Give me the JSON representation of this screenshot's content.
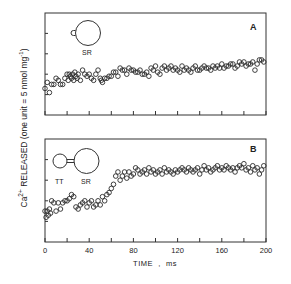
{
  "chart_data": [
    {
      "type": "scatter",
      "panel": "A",
      "panel_label": "A",
      "inset": {
        "labels": [
          "SR"
        ],
        "description": "small TT vesicle attached to large SR vesicle (isolated SR)"
      },
      "xlabel": "TIME , ms",
      "ylabel": "Ca2+ RELEASED (one unit = 5 nmol mg-1)",
      "xlim": [
        0,
        200
      ],
      "ylim": [
        0,
        5
      ],
      "x_ticks": [
        0,
        20,
        40,
        60,
        80,
        100,
        120,
        140,
        160,
        180,
        200
      ],
      "y_ticks": [
        1,
        2,
        3,
        4
      ],
      "marker": "open-circle",
      "x": [
        0,
        2,
        4,
        6,
        8,
        10,
        12,
        14,
        16,
        18,
        20,
        21,
        22,
        23,
        24,
        25,
        26,
        27,
        28,
        29,
        30,
        32,
        34,
        36,
        38,
        40,
        42,
        44,
        46,
        48,
        50,
        51,
        52,
        54,
        56,
        58,
        60,
        62,
        64,
        66,
        68,
        70,
        72,
        74,
        76,
        78,
        80,
        82,
        84,
        86,
        88,
        90,
        92,
        94,
        96,
        98,
        100,
        102,
        104,
        106,
        108,
        110,
        112,
        114,
        116,
        118,
        120,
        122,
        124,
        126,
        128,
        130,
        132,
        134,
        136,
        138,
        140,
        142,
        144,
        146,
        148,
        150,
        152,
        154,
        156,
        158,
        160,
        162,
        164,
        166,
        168,
        170,
        172,
        174,
        176,
        178,
        180,
        182,
        184,
        186,
        188,
        190,
        192,
        194,
        196,
        198
      ],
      "values": [
        1.3,
        1.6,
        1.1,
        1.5,
        1.5,
        1.8,
        1.7,
        1.5,
        1.5,
        1.8,
        2.0,
        1.7,
        2.0,
        1.9,
        1.8,
        2.0,
        1.7,
        2.1,
        1.9,
        1.8,
        2.0,
        1.7,
        2.2,
        2.0,
        1.9,
        2.0,
        1.8,
        1.7,
        2.0,
        2.2,
        1.8,
        1.7,
        1.6,
        1.8,
        1.8,
        1.9,
        1.9,
        2.1,
        2.1,
        1.9,
        2.3,
        2.2,
        2.2,
        2.0,
        2.3,
        2.2,
        2.2,
        2.1,
        2.1,
        2.2,
        2.0,
        2.0,
        2.1,
        1.9,
        2.3,
        2.2,
        2.4,
        2.1,
        2.0,
        2.3,
        2.4,
        2.2,
        2.3,
        2.4,
        2.2,
        2.3,
        2.2,
        2.1,
        2.4,
        2.2,
        2.3,
        2.2,
        2.1,
        2.3,
        2.4,
        2.2,
        2.2,
        2.3,
        2.4,
        2.3,
        2.3,
        2.2,
        2.4,
        2.3,
        2.4,
        2.3,
        2.5,
        2.3,
        2.4,
        2.4,
        2.5,
        2.5,
        2.3,
        2.4,
        2.6,
        2.5,
        2.6,
        2.4,
        2.5,
        2.5,
        2.6,
        2.2,
        2.5,
        2.7,
        2.7,
        2.6
      ]
    },
    {
      "type": "scatter",
      "panel": "B",
      "panel_label": "B",
      "inset": {
        "labels": [
          "TT",
          "SR"
        ],
        "description": "TT vesicle joined to SR vesicle (triad)"
      },
      "xlabel": "TIME , ms",
      "ylabel": "Ca2+ RELEASED (one unit = 5 nmol mg-1)",
      "xlim": [
        0,
        200
      ],
      "ylim": [
        0,
        5
      ],
      "x_ticks": [
        0,
        20,
        40,
        60,
        80,
        100,
        120,
        140,
        160,
        180,
        200
      ],
      "x_tick_labels": [
        "0",
        "40",
        "80",
        "120",
        "160",
        "200"
      ],
      "y_ticks": [
        1,
        2,
        3,
        4
      ],
      "marker": "open-circle",
      "x": [
        0,
        1,
        2,
        3,
        4,
        5,
        6,
        8,
        10,
        12,
        14,
        16,
        18,
        20,
        22,
        24,
        26,
        28,
        30,
        32,
        34,
        36,
        38,
        40,
        42,
        44,
        46,
        48,
        50,
        52,
        54,
        56,
        58,
        60,
        62,
        64,
        66,
        68,
        70,
        72,
        74,
        76,
        78,
        80,
        82,
        84,
        86,
        88,
        90,
        92,
        94,
        96,
        98,
        100,
        102,
        104,
        106,
        108,
        110,
        112,
        114,
        116,
        118,
        120,
        122,
        124,
        126,
        128,
        130,
        132,
        134,
        136,
        138,
        140,
        142,
        144,
        146,
        148,
        150,
        152,
        154,
        156,
        158,
        160,
        162,
        164,
        166,
        168,
        170,
        172,
        174,
        176,
        178,
        180,
        182,
        184,
        186,
        188,
        190,
        192,
        194,
        196,
        198
      ],
      "values": [
        1.5,
        1.2,
        1.5,
        1.3,
        1.6,
        1.4,
        2.0,
        1.9,
        1.5,
        1.9,
        1.6,
        1.9,
        2.0,
        2.0,
        2.1,
        2.3,
        2.2,
        1.7,
        1.6,
        1.8,
        1.9,
        2.0,
        1.7,
        1.9,
        2.0,
        1.7,
        1.8,
        2.0,
        1.8,
        2.2,
        2.0,
        2.3,
        2.4,
        2.6,
        2.8,
        3.2,
        3.4,
        3.0,
        3.2,
        3.4,
        3.1,
        3.4,
        3.2,
        3.3,
        3.6,
        3.5,
        3.3,
        3.4,
        3.5,
        3.3,
        3.6,
        3.4,
        3.5,
        3.3,
        3.4,
        3.5,
        3.3,
        3.6,
        3.4,
        3.5,
        3.4,
        3.3,
        3.5,
        3.4,
        3.5,
        3.6,
        3.5,
        3.4,
        3.6,
        3.5,
        3.4,
        3.5,
        3.6,
        3.3,
        3.5,
        3.7,
        3.5,
        3.6,
        3.4,
        3.5,
        3.6,
        3.7,
        3.5,
        3.6,
        3.5,
        3.7,
        3.6,
        3.5,
        3.6,
        3.4,
        3.6,
        3.7,
        3.6,
        3.8,
        3.5,
        3.6,
        3.4,
        3.7,
        3.5,
        3.6,
        3.3,
        3.5,
        3.7
      ]
    }
  ],
  "figure": {
    "panel_a_label": "A",
    "panel_b_label": "B",
    "inset_a_sr_label": "SR",
    "inset_b_tt_label": "TT",
    "inset_b_sr_label": "SR",
    "xaxis_title": "TIME  ,  ms",
    "xaxis_tick_labels": [
      "0",
      "40",
      "80",
      "120",
      "160",
      "200"
    ],
    "yaxis_title_ca": "Ca",
    "yaxis_title_sup": "2+",
    "yaxis_title_rest": " RELEASED (one unit = 5 nmol mg",
    "yaxis_title_exp": "-1",
    "yaxis_title_end": ")"
  }
}
